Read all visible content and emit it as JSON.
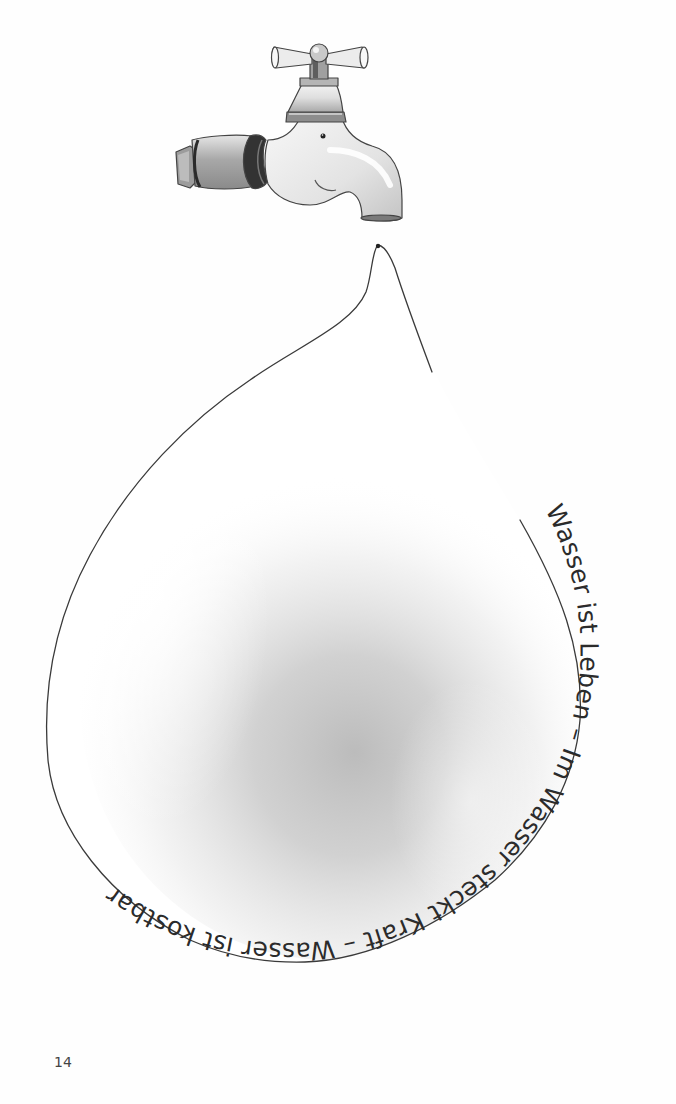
{
  "page": {
    "number": "14",
    "background": "#fefefe"
  },
  "illustration": {
    "subject": "water-tap-with-droplet",
    "faucet_icon": "faucet-icon",
    "drop_icon": "water-drop-icon",
    "colors": {
      "outline": "#3a3a3a",
      "shade": "#bdbdbd",
      "text": "#2b2b2b"
    }
  },
  "curved_text": {
    "full": "Wasser ist Leben – Im Wasser steckt Kraft – Wasser ist kostbar",
    "phrases": [
      "Wasser ist Leben",
      "Im Wasser steckt Kraft",
      "Wasser ist kostbar"
    ],
    "separator": "–"
  }
}
